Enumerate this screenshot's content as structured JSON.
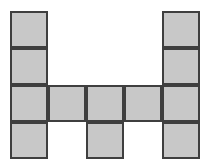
{
  "figure": {
    "name": "polyomino-grid-figure",
    "shape_label": "H",
    "canvas": {
      "width": 208,
      "height": 168,
      "background_color": "#ffffff"
    },
    "grid": {
      "origin_x": 10,
      "origin_y": 11,
      "columns": 5,
      "rows": 4,
      "cell_width": 38,
      "cell_height": 37,
      "total_cells": 20,
      "filled_count": 11,
      "empty_count": 9
    },
    "style": {
      "fill_color": "#c8c8c8",
      "border_color": "#3f3f3f",
      "border_width": 2
    },
    "rows": [
      {
        "index": 1,
        "cells": [
          {
            "col": 1,
            "filled": true
          },
          {
            "col": 2,
            "filled": false
          },
          {
            "col": 3,
            "filled": false
          },
          {
            "col": 4,
            "filled": false
          },
          {
            "col": 5,
            "filled": true
          }
        ]
      },
      {
        "index": 2,
        "cells": [
          {
            "col": 1,
            "filled": true
          },
          {
            "col": 2,
            "filled": false
          },
          {
            "col": 3,
            "filled": false
          },
          {
            "col": 4,
            "filled": false
          },
          {
            "col": 5,
            "filled": true
          }
        ]
      },
      {
        "index": 3,
        "cells": [
          {
            "col": 1,
            "filled": true
          },
          {
            "col": 2,
            "filled": true
          },
          {
            "col": 3,
            "filled": true
          },
          {
            "col": 4,
            "filled": true
          },
          {
            "col": 5,
            "filled": true
          }
        ]
      },
      {
        "index": 4,
        "cells": [
          {
            "col": 1,
            "filled": true
          },
          {
            "col": 2,
            "filled": false
          },
          {
            "col": 3,
            "filled": true
          },
          {
            "col": 4,
            "filled": false
          },
          {
            "col": 5,
            "filled": true
          }
        ]
      }
    ]
  }
}
